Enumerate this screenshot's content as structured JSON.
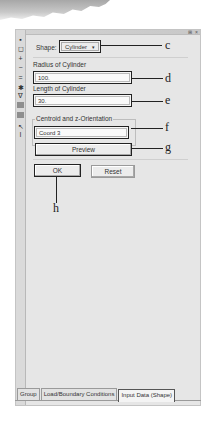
{
  "window": {
    "title_controls": "⊞ ×"
  },
  "toolbar": {
    "tools": [
      {
        "name": "select-icon",
        "glyph": "▪"
      },
      {
        "name": "box-select-icon",
        "glyph": "◻"
      },
      {
        "name": "add-icon",
        "glyph": "+"
      },
      {
        "name": "minus-icon",
        "glyph": "−"
      },
      {
        "name": "equals-icon",
        "glyph": "="
      },
      {
        "name": "node-icon",
        "glyph": "✱"
      },
      {
        "name": "filter-icon",
        "glyph": "∇"
      },
      {
        "name": "block-icon-1",
        "glyph": ""
      },
      {
        "name": "block-icon-2",
        "glyph": ""
      },
      {
        "name": "pointer-icon",
        "glyph": "↖"
      },
      {
        "name": "text-icon",
        "glyph": "I"
      }
    ]
  },
  "form": {
    "shape_label": "Shape:",
    "shape_value": "Cylinder",
    "shape_caret": "▾",
    "radius_label": "Radius of Cylinder",
    "radius_value": "100.",
    "length_label": "Length of Cylinder",
    "length_value": "30.",
    "centroid_label": "Centroid and z-Orientation",
    "centroid_value": "Coord 3",
    "preview_label": "Preview",
    "ok_label": "OK",
    "reset_label": "Reset"
  },
  "callouts": {
    "c": "c",
    "d": "d",
    "e": "e",
    "f": "f",
    "g": "g",
    "h": "h"
  },
  "tabs": [
    {
      "label": "Group",
      "active": false
    },
    {
      "label": "Load/Boundary Conditions",
      "active": false
    },
    {
      "label": "Input Data (Shape)",
      "active": true
    }
  ]
}
